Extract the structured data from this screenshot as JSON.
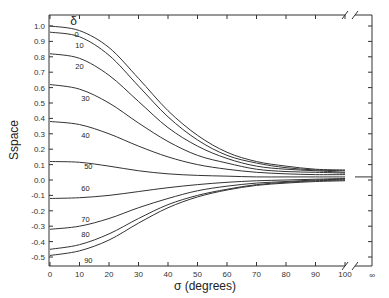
{
  "chart_data": {
    "type": "line",
    "title": "",
    "xlabel": "σ  (degrees)",
    "ylabel": "Sspace",
    "legend_header": "δ",
    "xlim": [
      0,
      100
    ],
    "x_extra_tick": "∞",
    "ylim": [
      -0.55,
      1.05
    ],
    "x_ticks": [
      0,
      10,
      20,
      30,
      40,
      50,
      60,
      70,
      80,
      90,
      100
    ],
    "y_ticks": [
      1.0,
      0.9,
      0.8,
      0.7,
      0.6,
      0.5,
      0.4,
      0.3,
      0.2,
      0.1,
      0.0,
      -0.1,
      -0.2,
      -0.3,
      -0.4,
      -0.5
    ],
    "y_tick_labels": [
      "1.0",
      "0.9",
      "0.8",
      "0.7",
      "0.6",
      "0.5",
      "0.4",
      "0.3",
      "0.2",
      "0.1",
      "0.0",
      "-0.1",
      "-0.2",
      "-0.3",
      "-0.4",
      "-0.5"
    ],
    "grid": false,
    "x": [
      0,
      10,
      20,
      30,
      40,
      50,
      60,
      70,
      80,
      90,
      100
    ],
    "series": [
      {
        "name": "0",
        "values": [
          1.0,
          0.97,
          0.86,
          0.66,
          0.45,
          0.29,
          0.18,
          0.12,
          0.09,
          0.07,
          0.065
        ]
      },
      {
        "name": "10",
        "values": [
          0.96,
          0.93,
          0.81,
          0.61,
          0.41,
          0.26,
          0.16,
          0.11,
          0.08,
          0.065,
          0.06
        ]
      },
      {
        "name": "20",
        "values": [
          0.82,
          0.79,
          0.68,
          0.51,
          0.34,
          0.22,
          0.14,
          0.09,
          0.07,
          0.06,
          0.05
        ]
      },
      {
        "name": "30",
        "values": [
          0.62,
          0.59,
          0.5,
          0.37,
          0.25,
          0.16,
          0.11,
          0.07,
          0.055,
          0.05,
          0.045
        ]
      },
      {
        "name": "40",
        "values": [
          0.38,
          0.36,
          0.3,
          0.22,
          0.15,
          0.1,
          0.07,
          0.05,
          0.04,
          0.035,
          0.035
        ]
      },
      {
        "name": "50",
        "values": [
          0.12,
          0.115,
          0.09,
          0.06,
          0.04,
          0.03,
          0.025,
          0.02,
          0.02,
          0.02,
          0.02
        ]
      },
      {
        "name": "60",
        "values": [
          -0.12,
          -0.115,
          -0.1,
          -0.075,
          -0.05,
          -0.03,
          -0.015,
          -0.005,
          0.0,
          0.005,
          0.01
        ]
      },
      {
        "name": "70",
        "values": [
          -0.32,
          -0.3,
          -0.25,
          -0.18,
          -0.12,
          -0.07,
          -0.04,
          -0.02,
          -0.01,
          0.0,
          0.005
        ]
      },
      {
        "name": "80",
        "values": [
          -0.45,
          -0.42,
          -0.35,
          -0.25,
          -0.16,
          -0.1,
          -0.06,
          -0.03,
          -0.015,
          -0.005,
          0.0
        ]
      },
      {
        "name": "90",
        "values": [
          -0.49,
          -0.46,
          -0.39,
          -0.28,
          -0.18,
          -0.11,
          -0.065,
          -0.035,
          -0.02,
          -0.01,
          -0.005
        ]
      }
    ],
    "asymptote_at_infinity": 0.02,
    "label_positions": [
      {
        "name": "0",
        "x": 9,
        "y": 0.93
      },
      {
        "name": "10",
        "x": 10,
        "y": 0.86
      },
      {
        "name": "20",
        "x": 10,
        "y": 0.72
      },
      {
        "name": "30",
        "x": 12,
        "y": 0.51
      },
      {
        "name": "40",
        "x": 12,
        "y": 0.27
      },
      {
        "name": "50",
        "x": 13,
        "y": 0.07
      },
      {
        "name": "60",
        "x": 12,
        "y": -0.07
      },
      {
        "name": "70",
        "x": 12,
        "y": -0.27
      },
      {
        "name": "80",
        "x": 12,
        "y": -0.37
      },
      {
        "name": "90",
        "x": 13,
        "y": -0.54
      }
    ]
  }
}
